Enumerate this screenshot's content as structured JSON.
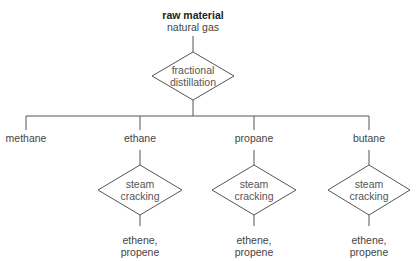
{
  "diagram": {
    "root": {
      "title": "raw material",
      "subtitle": "natural gas"
    },
    "process": {
      "line1": "fractional",
      "line2": "distillation"
    },
    "products": [
      {
        "label": "methane"
      },
      {
        "label": "ethane",
        "process": {
          "line1": "steam",
          "line2": "cracking"
        },
        "output": {
          "line1": "ethene,",
          "line2": "propene"
        }
      },
      {
        "label": "propane",
        "process": {
          "line1": "steam",
          "line2": "cracking"
        },
        "output": {
          "line1": "ethene,",
          "line2": "propene"
        }
      },
      {
        "label": "butane",
        "process": {
          "line1": "steam",
          "line2": "cracking"
        },
        "output": {
          "line1": "ethene,",
          "line2": "propene"
        }
      }
    ],
    "colors": {
      "line": "#555555",
      "text": "#444444"
    }
  }
}
